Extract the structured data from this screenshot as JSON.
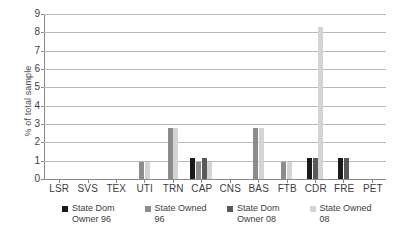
{
  "chart_data": {
    "type": "bar",
    "title": "",
    "xlabel": "",
    "ylabel": "% of total sample",
    "ylim": [
      0,
      9
    ],
    "ytick_labels": [
      "0",
      "1",
      "2",
      "3",
      "4",
      "5",
      "6",
      "7",
      "8",
      "9"
    ],
    "grid": true,
    "legend_position": "bottom",
    "categories": [
      "LSR",
      "SVS",
      "TEX",
      "UTI",
      "TRN",
      "CAP",
      "CNS",
      "BAS",
      "FTB",
      "CDR",
      "FRE",
      "PET"
    ],
    "series": [
      {
        "name": "State Dom Owner 96",
        "color": "#1a1a1a",
        "values": [
          0,
          0,
          0,
          0,
          0,
          1.15,
          0,
          0,
          0,
          1.15,
          1.15,
          0
        ]
      },
      {
        "name": "State Owned 96",
        "color": "#8c8c8c",
        "values": [
          0,
          0,
          0,
          0.95,
          2.8,
          0.95,
          0,
          2.8,
          0.95,
          0,
          0,
          0
        ]
      },
      {
        "name": "State Dom Owner 08",
        "color": "#595959",
        "values": [
          0,
          0,
          0,
          0,
          0,
          1.15,
          0,
          0,
          0,
          1.15,
          1.15,
          0
        ]
      },
      {
        "name": "State Owned 08",
        "color": "#d4d4d4",
        "values": [
          0,
          0,
          0,
          0.95,
          2.8,
          0.95,
          0,
          2.8,
          0.95,
          8.3,
          0,
          0
        ]
      }
    ]
  },
  "legend": {
    "items": [
      {
        "label_line1": "State Dom",
        "label_line2": "Owner 96",
        "color": "#1a1a1a"
      },
      {
        "label_line1": "State Owned",
        "label_line2": "96",
        "color": "#8c8c8c"
      },
      {
        "label_line1": "State Dom",
        "label_line2": "Owner 08",
        "color": "#595959"
      },
      {
        "label_line1": "State Owned",
        "label_line2": "08",
        "color": "#d4d4d4"
      }
    ]
  }
}
